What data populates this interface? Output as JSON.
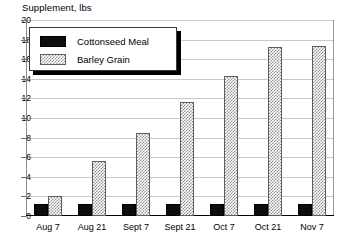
{
  "chart_data": {
    "type": "bar",
    "title": "Supplement, lbs",
    "xlabel": "",
    "ylabel": "",
    "ylim": [
      0,
      20
    ],
    "ytick_step": 2,
    "yticks": [
      0,
      2,
      4,
      6,
      8,
      10,
      12,
      14,
      16,
      18,
      20
    ],
    "ytick_labels": [
      "0",
      "2",
      "4",
      "6",
      "8",
      "10",
      "12",
      "14",
      "16",
      "18",
      "20"
    ],
    "grid": true,
    "legend_position": "top-left",
    "categories": [
      "Aug 7",
      "Aug 21",
      "Sept 7",
      "Sept 21",
      "Oct 7",
      "Oct 21",
      "Nov 7"
    ],
    "series": [
      {
        "name": "Cottonseed Meal",
        "fill": "solid-black",
        "color": "#0d0d0d",
        "values": [
          1.2,
          1.2,
          1.2,
          1.2,
          1.2,
          1.2,
          1.2
        ]
      },
      {
        "name": "Barley Grain",
        "fill": "checkered-gray",
        "color": "#8f8f8f",
        "values": [
          2.0,
          5.6,
          8.5,
          11.6,
          14.3,
          17.2,
          17.3
        ]
      }
    ]
  },
  "legend": {
    "items": [
      {
        "label": "Cottonseed Meal",
        "swatch": "solid-black-swatch"
      },
      {
        "label": "Barley Grain",
        "swatch": "checkered-gray-swatch"
      }
    ]
  },
  "colors": {
    "cottonseed": "#0d0d0d",
    "barley_hatch": "#8f8f8f",
    "grid": "#c9c9c9",
    "frame": "#9a9a9a",
    "axis": "#000000",
    "text": "#000000",
    "background": "#ffffff"
  }
}
